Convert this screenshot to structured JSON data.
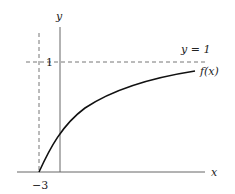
{
  "figure": {
    "x_axis_label": "x",
    "y_axis_label": "y",
    "asymptote_label": "y = 1",
    "curve_label": "f(x)",
    "y_tick_label": "1",
    "x_tick_label": "−3"
  },
  "colors": {
    "axis": "#555555",
    "curve": "#111111",
    "dashed": "#666666"
  }
}
